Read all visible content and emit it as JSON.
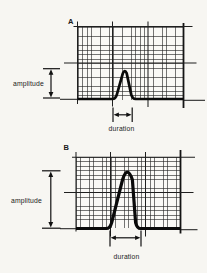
{
  "figure": {
    "panels": [
      {
        "id": "A",
        "amplitude_label": "amplitude",
        "duration_label": "duration",
        "pulse": {
          "shape": "narrow triangular pulse",
          "amplitude_divisions": 0.8,
          "duration_divisions": 0.55
        }
      },
      {
        "id": "B",
        "amplitude_label": "amplitude",
        "duration_label": "duration",
        "pulse": {
          "shape": "tall triangular pulse",
          "amplitude_divisions": 1.6,
          "duration_divisions": 0.85
        }
      }
    ],
    "grid": {
      "minor_cells_per_major": 8,
      "major_columns": 3,
      "major_rows": 2
    }
  },
  "colors": {
    "background": "#f7f6f2",
    "grid_minor": "#3a3a3a",
    "grid_major": "#1f1f1f",
    "trace": "#0a0a0a",
    "text": "#1b1b1b"
  }
}
